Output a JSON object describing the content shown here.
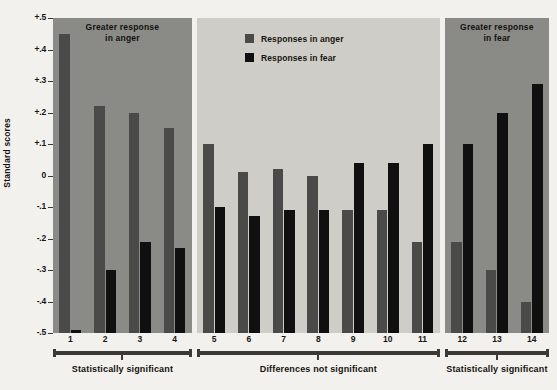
{
  "chart_data": {
    "type": "bar",
    "title": "",
    "xlabel": "",
    "ylabel": "Standard scores",
    "ylim": [
      -0.5,
      0.5
    ],
    "grid": false,
    "legend_position": "top-center",
    "baseline": -0.5,
    "note": "Bars are drawn from the -.5 floor up to their value; paired bars per item (anger, fear).",
    "categories": [
      "1",
      "2",
      "3",
      "4",
      "5",
      "6",
      "7",
      "8",
      "9",
      "10",
      "11",
      "12",
      "13",
      "14"
    ],
    "ytick_labels": [
      "+.5",
      "+.4",
      "+.3",
      "+.2",
      "+.1",
      "0",
      "-.1",
      "-.2",
      "-.3",
      "-.4",
      "-.5"
    ],
    "ytick_values": [
      0.5,
      0.4,
      0.3,
      0.2,
      0.1,
      0.0,
      -0.1,
      -0.2,
      -0.3,
      -0.4,
      -0.5
    ],
    "series": [
      {
        "name": "Responses in anger",
        "color": "#4a4a48",
        "values": [
          0.45,
          0.22,
          0.2,
          0.15,
          0.1,
          0.01,
          0.02,
          0.0,
          -0.11,
          -0.11,
          -0.21,
          -0.21,
          -0.3,
          -0.4
        ]
      },
      {
        "name": "Responses in fear",
        "color": "#101010",
        "values": [
          -0.49,
          -0.3,
          -0.21,
          -0.23,
          -0.1,
          -0.13,
          -0.11,
          -0.11,
          0.04,
          0.04,
          0.1,
          0.1,
          0.2,
          0.29
        ]
      }
    ],
    "panels": [
      {
        "id": "left",
        "title": "Greater response\nin anger",
        "title_line1": "Greater response",
        "title_line2": "in anger",
        "background": "#8a8a86",
        "categories": [
          "1",
          "2",
          "3",
          "4"
        ],
        "group_label": "Statistically significant"
      },
      {
        "id": "middle",
        "title": "",
        "title_line1": "",
        "title_line2": "",
        "background": "#cfcdc8",
        "categories": [
          "5",
          "6",
          "7",
          "8",
          "9",
          "10",
          "11"
        ],
        "group_label": "Differences not significant"
      },
      {
        "id": "right",
        "title": "Greater response\nin fear",
        "title_line1": "Greater response",
        "title_line2": "in fear",
        "background": "#8a8a86",
        "categories": [
          "12",
          "13",
          "14"
        ],
        "group_label": "Statistically significant"
      }
    ],
    "legend": [
      {
        "label": "Responses in anger",
        "color": "#4a4a48"
      },
      {
        "label": "Responses in fear",
        "color": "#101010"
      }
    ]
  },
  "colors": {
    "page_background": "#f3f1ed",
    "panel_dark": "#8a8a86",
    "panel_light": "#cfcdc8",
    "anger": "#4a4a48",
    "fear": "#101010",
    "axis_ink": "#17150f"
  }
}
